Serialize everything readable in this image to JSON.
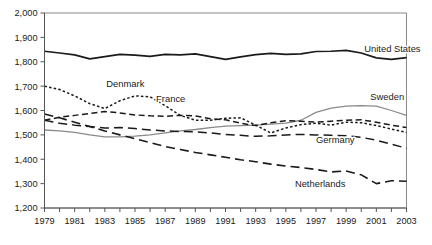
{
  "chart_data": {
    "type": "line",
    "title": "",
    "xlabel": "",
    "ylabel": "",
    "xlim": [
      1979,
      2003
    ],
    "ylim": [
      1200,
      2000
    ],
    "yticks": [
      "1,200",
      "1,300",
      "1,400",
      "1,500",
      "1,600",
      "1,700",
      "1,800",
      "1,900",
      "2,000"
    ],
    "ytick_values": [
      1200,
      1300,
      1400,
      1500,
      1600,
      1700,
      1800,
      1900,
      2000
    ],
    "xticks": [
      "1979",
      "1981",
      "1983",
      "1985",
      "1987",
      "1989",
      "1991",
      "1993",
      "1995",
      "1997",
      "1999",
      "2001",
      "2003"
    ],
    "xtick_values": [
      1979,
      1981,
      1983,
      1985,
      1987,
      1989,
      1991,
      1993,
      1995,
      1997,
      1999,
      2001,
      2003
    ],
    "x": [
      1979,
      1980,
      1981,
      1982,
      1983,
      1984,
      1985,
      1986,
      1987,
      1988,
      1989,
      1990,
      1991,
      1992,
      1993,
      1994,
      1995,
      1996,
      1997,
      1998,
      1999,
      2000,
      2001,
      2002,
      2003
    ],
    "grid": false,
    "legend_position": "inline-labels",
    "series": [
      {
        "name": "United States",
        "style": "solid",
        "color": "#1a1a1a",
        "width": 1.7,
        "label_x": 2000.2,
        "label_y": 1838,
        "values": [
          1843,
          1836,
          1828,
          1812,
          1821,
          1830,
          1827,
          1822,
          1830,
          1828,
          1832,
          1821,
          1810,
          1820,
          1829,
          1834,
          1830,
          1832,
          1842,
          1843,
          1847,
          1836,
          1816,
          1810,
          1817
        ]
      },
      {
        "name": "Sweden",
        "style": "solid",
        "color": "#8a8a8a",
        "width": 1.3,
        "label_x": 2000.6,
        "label_y": 1642,
        "values": [
          1520,
          1516,
          1510,
          1500,
          1492,
          1492,
          1495,
          1500,
          1508,
          1516,
          1522,
          1530,
          1536,
          1538,
          1540,
          1544,
          1548,
          1560,
          1592,
          1610,
          1618,
          1620,
          1618,
          1600,
          1580
        ]
      },
      {
        "name": "Denmark",
        "style": "dotted",
        "color": "#1a1a1a",
        "width": 1.5,
        "label_x": 1983.1,
        "label_y": 1696,
        "values": [
          1700,
          1686,
          1660,
          1628,
          1608,
          1640,
          1660,
          1656,
          1620,
          1580,
          1560,
          1560,
          1568,
          1570,
          1540,
          1508,
          1528,
          1542,
          1548,
          1540,
          1552,
          1550,
          1538,
          1524,
          1510
        ]
      },
      {
        "name": "France",
        "style": "dashed",
        "color": "#1a1a1a",
        "width": 1.5,
        "label_x": 1986.4,
        "label_y": 1636,
        "values": [
          1560,
          1572,
          1580,
          1588,
          1596,
          1590,
          1582,
          1578,
          1576,
          1580,
          1578,
          1566,
          1562,
          1548,
          1538,
          1550,
          1558,
          1556,
          1552,
          1556,
          1560,
          1562,
          1552,
          1540,
          1530
        ]
      },
      {
        "name": "Germany",
        "style": "long-dashed",
        "color": "#1a1a1a",
        "width": 1.5,
        "label_x": 1997.0,
        "label_y": 1466,
        "values": [
          1560,
          1548,
          1540,
          1534,
          1528,
          1530,
          1526,
          1520,
          1516,
          1514,
          1512,
          1508,
          1502,
          1498,
          1494,
          1496,
          1500,
          1502,
          1500,
          1498,
          1496,
          1490,
          1478,
          1462,
          1445
        ]
      },
      {
        "name": "Netherlands",
        "style": "long-dashed",
        "color": "#1a1a1a",
        "width": 1.6,
        "label_x": 1995.6,
        "label_y": 1288,
        "values": [
          1586,
          1570,
          1552,
          1534,
          1516,
          1500,
          1484,
          1468,
          1452,
          1440,
          1428,
          1418,
          1408,
          1398,
          1390,
          1380,
          1372,
          1366,
          1358,
          1348,
          1352,
          1336,
          1300,
          1312,
          1310
        ]
      }
    ]
  }
}
